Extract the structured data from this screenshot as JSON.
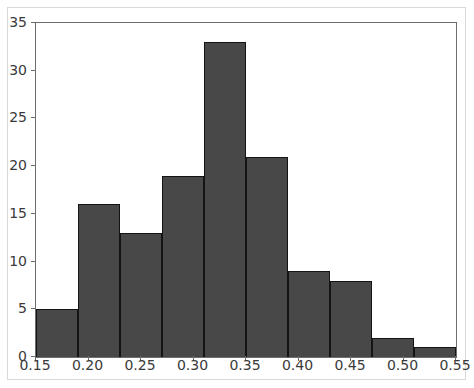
{
  "chart_data": {
    "type": "bar",
    "chart_kind": "histogram",
    "title": "",
    "subtitle": "",
    "xlabel": "",
    "ylabel": "",
    "legend": [],
    "legend_position": "none",
    "grid": false,
    "xlim": [
      0.15,
      0.55
    ],
    "ylim": [
      0,
      35
    ],
    "xticks": [
      0.15,
      0.2,
      0.25,
      0.3,
      0.35,
      0.4,
      0.45,
      0.5,
      0.55
    ],
    "xtick_labels": [
      "0.15",
      "0.20",
      "0.25",
      "0.30",
      "0.35",
      "0.40",
      "0.45",
      "0.50",
      "0.55"
    ],
    "yticks": [
      0,
      5,
      10,
      15,
      20,
      25,
      30,
      35
    ],
    "ytick_labels": [
      "0",
      "5",
      "10",
      "15",
      "20",
      "25",
      "30",
      "35"
    ],
    "bin_width": 0.04,
    "bin_edges": [
      0.15,
      0.19,
      0.23,
      0.27,
      0.31,
      0.35,
      0.39,
      0.43,
      0.47,
      0.51
    ],
    "bin_labels": [
      "0.15-0.19",
      "0.19-0.23",
      "0.23-0.27",
      "0.27-0.31",
      "0.31-0.35",
      "0.35-0.39",
      "0.39-0.43",
      "0.43-0.47",
      "0.47-0.51"
    ],
    "categories": [
      "0.15-0.19",
      "0.19-0.23",
      "0.23-0.27",
      "0.27-0.31",
      "0.31-0.35",
      "0.35-0.39",
      "0.39-0.43",
      "0.43-0.47",
      "0.47-0.51"
    ],
    "values": [
      5,
      16,
      13,
      19,
      33,
      21,
      9,
      8,
      2
    ],
    "bars": [
      {
        "bin_start": 0.15,
        "bin_end": 0.19,
        "value": 5
      },
      {
        "bin_start": 0.19,
        "bin_end": 0.23,
        "value": 16
      },
      {
        "bin_start": 0.23,
        "bin_end": 0.27,
        "value": 13
      },
      {
        "bin_start": 0.27,
        "bin_end": 0.31,
        "value": 19
      },
      {
        "bin_start": 0.31,
        "bin_end": 0.35,
        "value": 33
      },
      {
        "bin_start": 0.35,
        "bin_end": 0.39,
        "value": 21
      },
      {
        "bin_start": 0.39,
        "bin_end": 0.43,
        "value": 9
      },
      {
        "bin_start": 0.43,
        "bin_end": 0.47,
        "value": 8
      },
      {
        "bin_start": 0.47,
        "bin_end": 0.51,
        "value": 2
      },
      {
        "bin_start": 0.51,
        "bin_end": 0.55,
        "value": 1
      }
    ],
    "total_count": 127,
    "bar_color": "#484848",
    "bar_edge_color": "#141414",
    "axis_color": "#6d6d6d",
    "tick_label_color": "#3a3a3a",
    "background_color": "#ffffff",
    "frame_color": "#d9d9d9"
  }
}
